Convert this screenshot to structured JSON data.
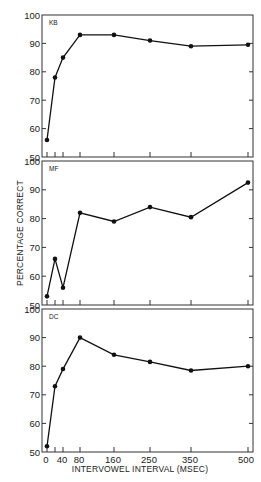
{
  "chart_data": {
    "type": "line",
    "title": "",
    "xlabel": "INTERVOWEL INTERVAL (MSEC)",
    "ylabel": "PERCENTAGE CORRECT",
    "x": [
      0,
      20,
      40,
      80,
      160,
      250,
      350,
      500
    ],
    "x_tick_labels": [
      "0",
      "40",
      "80",
      "160",
      "250",
      "350",
      "500"
    ],
    "x_tick_values": [
      0,
      20,
      40,
      80,
      160,
      250,
      350,
      500
    ],
    "y_ticks": [
      50,
      60,
      70,
      80,
      90,
      100
    ],
    "ylim": [
      50,
      100
    ],
    "grid": false,
    "legend": "none (panel labels in upper left)",
    "panels": [
      {
        "label": "KB",
        "values": [
          56,
          78,
          85,
          93,
          93,
          91,
          89,
          89.5
        ]
      },
      {
        "label": "MF",
        "values": [
          53,
          66,
          56,
          82,
          79,
          84,
          80.5,
          92.5
        ]
      },
      {
        "label": "DC",
        "values": [
          52,
          73,
          79,
          90,
          84,
          81.5,
          78.5,
          80
        ]
      }
    ]
  },
  "figure": {
    "ylabel": "PERCENTAGE CORRECT",
    "xlabel": "INTERVOWEL INTERVAL (MSEC)",
    "panel_labels": [
      "KB",
      "MF",
      "DC"
    ]
  }
}
